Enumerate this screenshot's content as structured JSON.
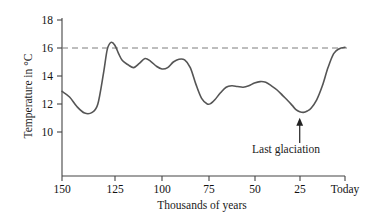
{
  "chart_data": {
    "type": "line",
    "title": "",
    "xlabel": "Thousands of years",
    "ylabel": "Temperature in °C",
    "xticks": [
      "150",
      "125",
      "100",
      "75",
      "50",
      "25",
      "Today"
    ],
    "xtick_values": [
      150,
      125,
      100,
      75,
      50,
      25,
      0
    ],
    "yticks": [
      "18",
      "16",
      "14",
      "12",
      "10"
    ],
    "ytick_values": [
      18,
      16,
      14,
      12,
      10
    ],
    "xlim": [
      150,
      0
    ],
    "ylim": [
      9,
      18
    ],
    "grid": false,
    "legend": null,
    "x_axis_direction": "decreasing-left-to-right",
    "reference_line": {
      "value": 16,
      "style": "dashed",
      "label": ""
    },
    "series": [
      {
        "name": "Temperature",
        "color": "#555555",
        "x": [
          150,
          146,
          142,
          138,
          134,
          131,
          128,
          126,
          124,
          122,
          120,
          118,
          115,
          112,
          109,
          106,
          103,
          100,
          97,
          94,
          91,
          88,
          85,
          82,
          79,
          76,
          73,
          71,
          69,
          66,
          63,
          60,
          57,
          54,
          51,
          48,
          45,
          42,
          39,
          36,
          33,
          30,
          28,
          26,
          24,
          22,
          20,
          18,
          15,
          12,
          9,
          6,
          3,
          0
        ],
        "y": [
          12.9,
          12.5,
          11.8,
          11.35,
          11.4,
          12.0,
          14.2,
          15.9,
          16.4,
          16.2,
          15.6,
          15.1,
          14.8,
          14.6,
          14.9,
          15.25,
          15.05,
          14.7,
          14.5,
          14.6,
          15.0,
          15.2,
          15.15,
          14.6,
          13.4,
          12.4,
          12.0,
          12.05,
          12.3,
          12.8,
          13.2,
          13.3,
          13.25,
          13.2,
          13.3,
          13.5,
          13.6,
          13.55,
          13.3,
          13.0,
          12.6,
          12.2,
          11.9,
          11.6,
          11.45,
          11.4,
          11.5,
          11.7,
          12.3,
          13.3,
          14.6,
          15.6,
          15.95,
          16.05
        ]
      }
    ],
    "annotations": [
      {
        "name": "last-glaciation",
        "text": "Last glaciation",
        "arrow": true,
        "points_to_x": 24,
        "points_to_y": 11.45
      }
    ]
  },
  "colors": {
    "curve": "#555555",
    "axis": "#444444",
    "dashed_line": "#888888",
    "text": "#111111",
    "background": "#ffffff"
  }
}
